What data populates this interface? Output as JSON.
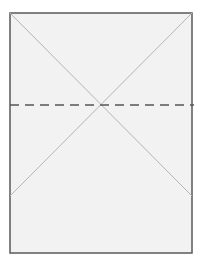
{
  "diagram": {
    "type": "paper-fold-diagram",
    "sheet": {
      "x": 10,
      "y": 13,
      "width": 182,
      "height": 240,
      "fill": "#f2f2f2",
      "stroke": "#5a5a5a"
    },
    "diagonals": [
      {
        "x1": 10,
        "y1": 13,
        "x2": 192,
        "y2": 196
      },
      {
        "x1": 192,
        "y1": 13,
        "x2": 10,
        "y2": 196
      }
    ],
    "diagonal_color": "#b5b5b5",
    "fold_line": {
      "x1": 10,
      "y1": 105,
      "x2": 194,
      "y2": 105,
      "style": "dashed",
      "color": "#555555"
    }
  }
}
